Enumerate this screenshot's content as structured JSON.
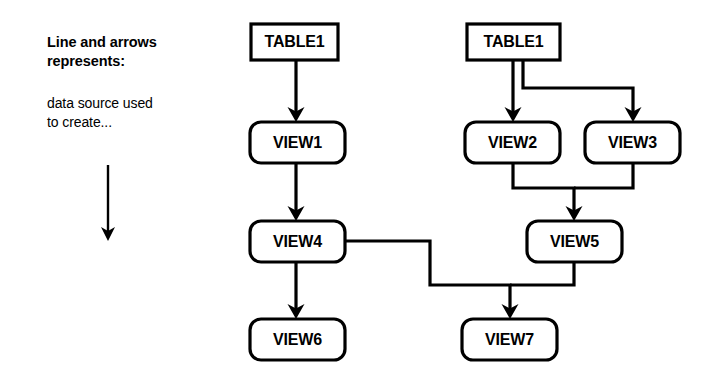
{
  "page": {
    "background_color": "#ffffff",
    "ink_color": "#000000",
    "width": 716,
    "height": 384
  },
  "legend": {
    "heading": "Line and arrows\nrepresents:",
    "body": "data source used\nto create...",
    "arrow_icon": "down-arrow-icon"
  },
  "diagram": {
    "type": "dependency-graph",
    "nodes": [
      {
        "id": "table1a",
        "label": "TABLE1",
        "shape": "rectangle",
        "x": 251,
        "y": 24,
        "w": 87,
        "h": 36
      },
      {
        "id": "view1",
        "label": "VIEW1",
        "shape": "rounded",
        "x": 250,
        "y": 122,
        "w": 95,
        "h": 41
      },
      {
        "id": "view4",
        "label": "VIEW4",
        "shape": "rounded",
        "x": 250,
        "y": 221,
        "w": 95,
        "h": 41
      },
      {
        "id": "view6",
        "label": "VIEW6",
        "shape": "rounded",
        "x": 250,
        "y": 319,
        "w": 95,
        "h": 41
      },
      {
        "id": "table1b",
        "label": "TABLE1",
        "shape": "rectangle",
        "x": 467,
        "y": 24,
        "w": 93,
        "h": 36
      },
      {
        "id": "view2",
        "label": "VIEW2",
        "shape": "rounded",
        "x": 465,
        "y": 122,
        "w": 95,
        "h": 41
      },
      {
        "id": "view3",
        "label": "VIEW3",
        "shape": "rounded",
        "x": 585,
        "y": 122,
        "w": 95,
        "h": 41
      },
      {
        "id": "view5",
        "label": "VIEW5",
        "shape": "rounded",
        "x": 527,
        "y": 221,
        "w": 95,
        "h": 41
      },
      {
        "id": "view7",
        "label": "VIEW7",
        "shape": "rounded",
        "x": 462,
        "y": 319,
        "w": 95,
        "h": 41
      }
    ],
    "edges": [
      {
        "id": "e-table1a-view1",
        "from": "table1a",
        "to": "view1",
        "points": "296,60 296,114",
        "arrow_at": "296,122",
        "arrow_dir": "down"
      },
      {
        "id": "e-view1-view4",
        "from": "view1",
        "to": "view4",
        "points": "296,163 296,213",
        "arrow_at": "296,221",
        "arrow_dir": "down"
      },
      {
        "id": "e-view4-view6",
        "from": "view4",
        "to": "view6",
        "points": "296,262 296,311",
        "arrow_at": "296,319",
        "arrow_dir": "down"
      },
      {
        "id": "e-view4-view7",
        "from": "view4",
        "to": "view7",
        "points": "345,241 430,241 430,285 510,285 510,311",
        "arrow_at": "510,319",
        "arrow_dir": "down"
      },
      {
        "id": "e-table1b-view2",
        "from": "table1b",
        "to": "view2",
        "points": "513,60 513,114",
        "arrow_at": "513,122",
        "arrow_dir": "down"
      },
      {
        "id": "e-table1b-view3",
        "from": "table1b",
        "to": "view3",
        "points": "523,60 523,88 633,88 633,114",
        "arrow_at": "633,122",
        "arrow_dir": "down"
      },
      {
        "id": "e-view2-view5",
        "from": "view2",
        "to": "view5",
        "points": "513,163 513,188 574,188 574,213",
        "arrow_at": "574,221",
        "arrow_dir": "down"
      },
      {
        "id": "e-view3-view5",
        "from": "view3",
        "to": "view5",
        "points": "633,163 633,188 574,188",
        "arrow_at": "",
        "arrow_dir": "none"
      },
      {
        "id": "e-view5-view7",
        "from": "view5",
        "to": "view7",
        "points": "574,262 574,285 510,285",
        "arrow_at": "",
        "arrow_dir": "none"
      }
    ],
    "legend_arrow": {
      "id": "legend-arrow",
      "points": "108,165 108,231",
      "arrow_at": "108,241",
      "arrow_dir": "down"
    }
  }
}
